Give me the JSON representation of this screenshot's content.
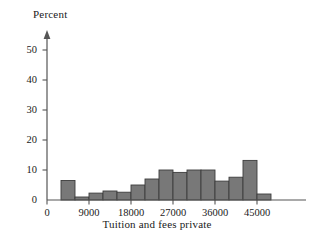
{
  "chart_data": {
    "type": "bar",
    "title": "",
    "xlabel": "Tuition and fees private",
    "ylabel": "Percent",
    "xlim": [
      0,
      51000
    ],
    "ylim": [
      0,
      55
    ],
    "grid": false,
    "legend": null,
    "bin_width": 3000,
    "x_ticks": [
      {
        "value": 0,
        "label": "0"
      },
      {
        "value": 9000,
        "label": "9000"
      },
      {
        "value": 18000,
        "label": "18000"
      },
      {
        "value": 27000,
        "label": "27000"
      },
      {
        "value": 36000,
        "label": "36000"
      },
      {
        "value": 45000,
        "label": "45000"
      }
    ],
    "y_ticks": [
      {
        "value": 0,
        "label": "0"
      },
      {
        "value": 10,
        "label": "10"
      },
      {
        "value": 20,
        "label": "20"
      },
      {
        "value": 30,
        "label": "30"
      },
      {
        "value": 40,
        "label": "40"
      },
      {
        "value": 50,
        "label": "50"
      }
    ],
    "bar_color": "#787878",
    "bar_edge_color": "#3c3c3c",
    "axis_color": "#555555",
    "bins": [
      {
        "start": 3000,
        "end": 6000,
        "value": 6.5
      },
      {
        "start": 6000,
        "end": 9000,
        "value": 1.0
      },
      {
        "start": 9000,
        "end": 12000,
        "value": 2.3
      },
      {
        "start": 12000,
        "end": 15000,
        "value": 3.0
      },
      {
        "start": 15000,
        "end": 18000,
        "value": 2.6
      },
      {
        "start": 18000,
        "end": 21000,
        "value": 5.0
      },
      {
        "start": 21000,
        "end": 24000,
        "value": 7.0
      },
      {
        "start": 24000,
        "end": 27000,
        "value": 10.0
      },
      {
        "start": 27000,
        "end": 30000,
        "value": 9.2
      },
      {
        "start": 30000,
        "end": 33000,
        "value": 10.0
      },
      {
        "start": 33000,
        "end": 36000,
        "value": 10.0
      },
      {
        "start": 36000,
        "end": 39000,
        "value": 6.3
      },
      {
        "start": 39000,
        "end": 42000,
        "value": 7.6
      },
      {
        "start": 42000,
        "end": 45000,
        "value": 13.2
      },
      {
        "start": 45000,
        "end": 48000,
        "value": 2.0
      }
    ],
    "categories": [
      "3000-6000",
      "6000-9000",
      "9000-12000",
      "12000-15000",
      "15000-18000",
      "18000-21000",
      "21000-24000",
      "24000-27000",
      "27000-30000",
      "30000-33000",
      "33000-36000",
      "36000-39000",
      "39000-42000",
      "42000-45000",
      "45000-48000"
    ],
    "values": [
      6.5,
      1.0,
      2.3,
      3.0,
      2.6,
      5.0,
      7.0,
      10.0,
      9.2,
      10.0,
      10.0,
      6.3,
      7.6,
      13.2,
      2.0
    ]
  }
}
